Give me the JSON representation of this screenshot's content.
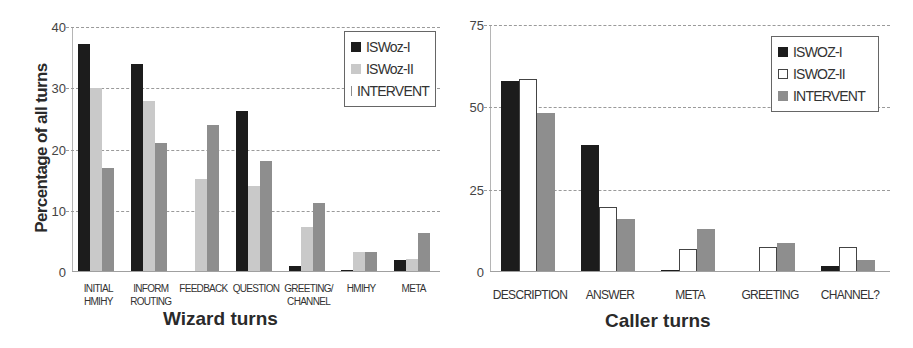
{
  "chart_data": [
    {
      "type": "bar",
      "title": "",
      "xlabel": "Wizard turns",
      "ylabel": "Percentage of all turns",
      "ylim": [
        0,
        40
      ],
      "yticks": [
        "0",
        "10",
        "20",
        "30",
        "40"
      ],
      "grid": true,
      "legend_position": "top-right",
      "categories": [
        "INITIAL\nHMIHY",
        "INFORM\nROUTING",
        "FEEDBACK",
        "QUESTION",
        "GREETING/\nCHANNEL",
        "HMIHY",
        "META"
      ],
      "series": [
        {
          "name": "ISWoz-I",
          "color": "#1c1c1c",
          "values": [
            37.3,
            34,
            0,
            26.3,
            1,
            0.4,
            2
          ]
        },
        {
          "name": "ISWoz-II",
          "color": "#c9c9c9",
          "values": [
            30,
            28,
            15.2,
            14,
            7.3,
            3.2,
            2.2
          ]
        },
        {
          "name": "INTERVENT",
          "color": "#8e8e8e",
          "values": [
            17,
            21,
            24,
            18.2,
            11.2,
            3.3,
            6.4
          ]
        }
      ]
    },
    {
      "type": "bar",
      "title": "",
      "xlabel": "Caller turns",
      "ylabel": "",
      "ylim": [
        0,
        75
      ],
      "yticks": [
        "0",
        "25",
        "50",
        "75"
      ],
      "grid": true,
      "legend_position": "top-right",
      "categories": [
        "DESCRIPTION",
        "ANSWER",
        "META",
        "GREETING",
        "CHANNEL?"
      ],
      "series": [
        {
          "name": "ISWOZ-I",
          "color": "#1c1c1c",
          "values": [
            58,
            38.5,
            0.7,
            0.2,
            1.9
          ]
        },
        {
          "name": "ISWOZ-II",
          "color": "#ffffff",
          "values": [
            58.5,
            19.8,
            7,
            7.6,
            7.7
          ]
        },
        {
          "name": "INTERVENT",
          "color": "#8e8e8e",
          "values": [
            48.3,
            16,
            13.2,
            8.9,
            3.8
          ]
        }
      ]
    }
  ]
}
